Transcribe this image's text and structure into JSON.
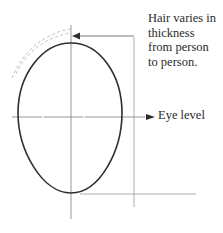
{
  "diagram": {
    "annotations": {
      "hair": [
        "Hair varies in",
        "thickness",
        "from person",
        "to person."
      ],
      "eye_level": "Eye level"
    },
    "colors": {
      "outline": "#2e2e2e",
      "guide": "#8a8a8a",
      "hair_dashed": "#b8b8b8",
      "text": "#2a2a2a",
      "background": "#ffffff"
    }
  }
}
